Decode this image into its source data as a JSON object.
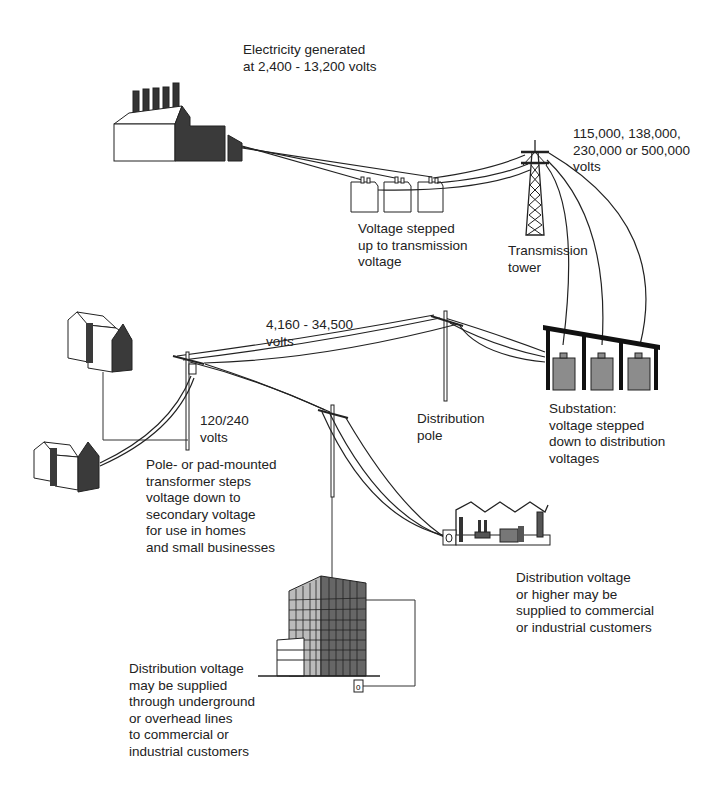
{
  "diagram": {
    "colors": {
      "background": "#ffffff",
      "ink": "#222222",
      "dark_fill": "#3a3a3a",
      "gray_fill": "#8c8c8c"
    },
    "labels": {
      "generation": "Electricity generated\nat 2,400 - 13,200 volts",
      "step_up": "Voltage stepped\nup to transmission\nvoltage",
      "transmission_voltage": "115,000, 138,000,\n230,000 or 500,000\nvolts",
      "transmission_tower": "Transmission\ntower",
      "distribution_voltage": "4,160 - 34,500\nvolts",
      "distribution_pole": "Distribution\npole",
      "substation": "Substation:\nvoltage stepped\ndown to distribution\nvoltages",
      "secondary_voltage": "120/240\nvolts",
      "pole_transformer": "Pole- or pad-mounted\ntransformer steps\nvoltage down to\nsecondary voltage\nfor use in homes\nand small businesses",
      "industrial_supply": "Distribution voltage\nor higher may be\nsupplied to commercial\nor industrial customers",
      "commercial_supply": "Distribution voltage\nmay be supplied\nthrough underground\nor overhead lines\nto commercial or\nindustrial customers"
    },
    "nodes": [
      {
        "id": "power-plant",
        "name": "Power plant"
      },
      {
        "id": "step-up-transformers",
        "name": "Step-up transformers",
        "count": 3
      },
      {
        "id": "transmission-tower",
        "name": "Transmission tower"
      },
      {
        "id": "substation",
        "name": "Substation",
        "count": 3
      },
      {
        "id": "distribution-pole",
        "name": "Distribution pole"
      },
      {
        "id": "pole-transformer",
        "name": "Pole-mounted transformer"
      },
      {
        "id": "houses",
        "name": "Homes",
        "count": 2
      },
      {
        "id": "factory",
        "name": "Industrial customer"
      },
      {
        "id": "office-building",
        "name": "Commercial building"
      }
    ]
  }
}
